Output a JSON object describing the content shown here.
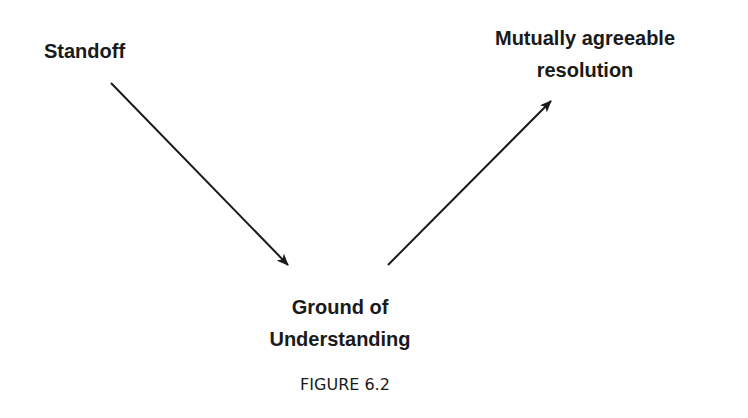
{
  "diagram": {
    "nodes": {
      "standoff": {
        "label": "Standoff"
      },
      "resolution": {
        "line1": "Mutually agreeable",
        "line2": "resolution"
      },
      "ground": {
        "line1": "Ground of",
        "line2": "Understanding"
      }
    },
    "edges": [
      {
        "from": "Standoff",
        "to": "Ground of Understanding"
      },
      {
        "from": "Ground of Understanding",
        "to": "Mutually agreeable resolution"
      }
    ],
    "caption": "FIGURE 6.2",
    "colors": {
      "line": "#1a1a1a",
      "background": "#ffffff"
    }
  }
}
